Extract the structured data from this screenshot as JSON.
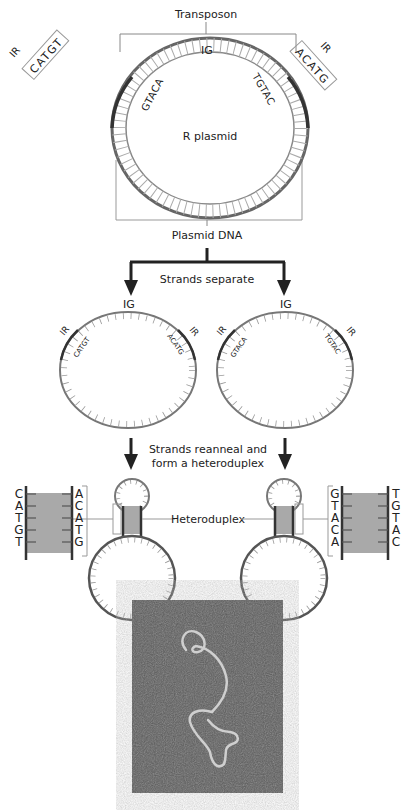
{
  "figure": {
    "labels": {
      "transposon": "Transposon",
      "ig": "IG",
      "ir": "IR",
      "r_plasmid": "R plasmid",
      "plasmid_dna": "Plasmid DNA",
      "strands_separate": "Strands separate",
      "reanneal_line1": "Strands reanneal and",
      "reanneal_line2": "form a heteroduplex",
      "heteroduplex": "Heteroduplex"
    },
    "sequences": {
      "ir_left_outer": "CATGT",
      "ir_left_inner": "GTACA",
      "ir_right_outer": "ACATG",
      "ir_right_inner": "TGTAC"
    },
    "single_strands": {
      "left": {
        "ig": "IG",
        "ir_left": "IR",
        "ir_right": "IR",
        "seq_left": "CATGT",
        "seq_right": "ACATG"
      },
      "right": {
        "ig": "IG",
        "ir_left": "IR",
        "ir_right": "IR",
        "seq_left": "GTACA",
        "seq_right": "TGTAC"
      }
    },
    "duplex_left": {
      "strand1": [
        "C",
        "A",
        "T",
        "G",
        "T"
      ],
      "strand2": [
        "A",
        "C",
        "A",
        "T",
        "G"
      ]
    },
    "duplex_right": {
      "strand1": [
        "G",
        "T",
        "A",
        "C",
        "A"
      ],
      "strand2": [
        "T",
        "G",
        "T",
        "A",
        "C"
      ]
    },
    "colors": {
      "strand": "#555555",
      "shade": "#a9a9a9",
      "photo_bg": "#5a5a5a"
    }
  }
}
